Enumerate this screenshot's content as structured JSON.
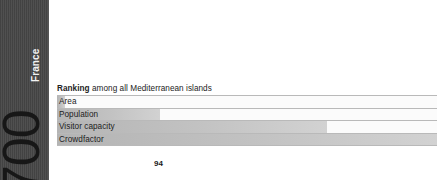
{
  "side_panel": {
    "big_number": "2700",
    "country_label": "France",
    "background_color": "#4a4a4a",
    "number_color": "#171717",
    "label_color": "#f2f2f2"
  },
  "ranking": {
    "title_bold": "Ranking",
    "title_rest": " among all Mediterranean islands"
  },
  "chart_data": {
    "type": "bar",
    "title": "Ranking among all Mediterranean islands",
    "orientation": "horizontal",
    "categories": [
      "Area",
      "Population",
      "Visitor capacity",
      "Crowdfactor"
    ],
    "values": [
      2,
      27,
      71,
      100
    ],
    "value_unit": "percent-of-track",
    "xlabel": "",
    "ylabel": "",
    "xlim": [
      0,
      100
    ],
    "grid": false,
    "legend": false,
    "bar_fill_color": "#c3c3c3",
    "track_color": "#fbfbfb",
    "row_border_color": "#b9b9b9"
  },
  "footer": {
    "page_number": "94"
  }
}
